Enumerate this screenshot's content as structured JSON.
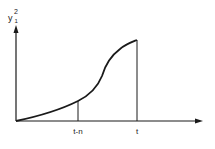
{
  "diagram": {
    "y_axis_label": {
      "base": "y",
      "superscript": "2",
      "subscript": "1"
    },
    "x_ticks": [
      {
        "label": "t-n",
        "x": 78
      },
      {
        "label": "t",
        "x": 137
      }
    ],
    "curve_description": "monotonically increasing S-shaped curve from origin to time t",
    "colors": {
      "line": "#1a1a1a",
      "background": "#ffffff"
    }
  }
}
